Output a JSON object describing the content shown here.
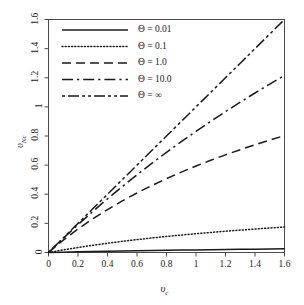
{
  "chart_data": {
    "type": "line",
    "title": "",
    "xlabel": "υc",
    "ylabel": "υNc",
    "xlabel_base": "υ",
    "xlabel_sub": "c",
    "ylabel_base": "υ",
    "ylabel_sub": "Nc",
    "xlim": [
      0,
      1.6
    ],
    "ylim": [
      0,
      1.6
    ],
    "grid": false,
    "legend_position": "top-left inside plot",
    "xticks": [
      "0",
      "0.2",
      "0.4",
      "0.6",
      "0.8",
      "1",
      "1.2",
      "1.4",
      "1.6"
    ],
    "xtick_values": [
      0,
      0.2,
      0.4,
      0.6,
      0.8,
      1,
      1.2,
      1.4,
      1.6
    ],
    "yticks": [
      "0",
      "0.2",
      "0.4",
      "0.6",
      "0.8",
      "1",
      "1.2",
      "1.4",
      "1.6"
    ],
    "ytick_values": [
      0,
      0.2,
      0.4,
      0.6,
      0.8,
      1,
      1.2,
      1.4,
      1.6
    ],
    "x": [
      0,
      0.1,
      0.2,
      0.3,
      0.4,
      0.5,
      0.6,
      0.7,
      0.8,
      0.9,
      1.0,
      1.1,
      1.2,
      1.3,
      1.4,
      1.5,
      1.6
    ],
    "series": [
      {
        "name": "Θ = 0.01",
        "key": "theta_0_01",
        "style": "solid",
        "color": "#1a1a1a",
        "dasharray": "",
        "values": [
          0,
          0.0022,
          0.0043,
          0.0063,
          0.0082,
          0.01,
          0.0117,
          0.0133,
          0.0149,
          0.0164,
          0.0178,
          0.0192,
          0.0205,
          0.0218,
          0.023,
          0.0242,
          0.0253
        ]
      },
      {
        "name": "Θ = 0.1",
        "key": "theta_0_1",
        "style": "dotted",
        "color": "#1a1a1a",
        "dasharray": "1,2.2",
        "values": [
          0,
          0.018,
          0.0345,
          0.0496,
          0.0636,
          0.0765,
          0.0885,
          0.0997,
          0.1101,
          0.1199,
          0.1291,
          0.1378,
          0.146,
          0.1538,
          0.1612,
          0.1682,
          0.1749
        ]
      },
      {
        "name": "Θ = 1.0",
        "key": "theta_1_0",
        "style": "dashed",
        "color": "#1a1a1a",
        "dasharray": "9,5",
        "values": [
          0,
          0.0847,
          0.1613,
          0.231,
          0.295,
          0.354,
          0.4087,
          0.4596,
          0.5071,
          0.5517,
          0.5936,
          0.6332,
          0.6706,
          0.7061,
          0.7399,
          0.7721,
          0.8028
        ]
      },
      {
        "name": "Θ = 10.0",
        "key": "theta_10_0",
        "style": "dash-dot",
        "color": "#1a1a1a",
        "dasharray": "11,4,2.2,4",
        "values": [
          0,
          0.0975,
          0.1913,
          0.2816,
          0.3687,
          0.4526,
          0.5336,
          0.6119,
          0.6876,
          0.7609,
          0.8319,
          0.9007,
          0.9675,
          1.0323,
          1.0953,
          1.1566,
          1.2162
        ]
      },
      {
        "name": "Θ = ∞",
        "key": "theta_inf",
        "style": "dash-dot-dot",
        "color": "#1a1a1a",
        "dasharray": "3,3,11,3,3,3",
        "values": [
          0,
          0.1,
          0.2,
          0.3,
          0.4,
          0.5,
          0.6,
          0.7,
          0.8,
          0.9,
          1.0,
          1.1,
          1.2,
          1.3,
          1.4,
          1.5,
          1.6
        ]
      }
    ]
  },
  "axes": {
    "frame_color": "#4a4a4a",
    "background": "#ffffff"
  }
}
